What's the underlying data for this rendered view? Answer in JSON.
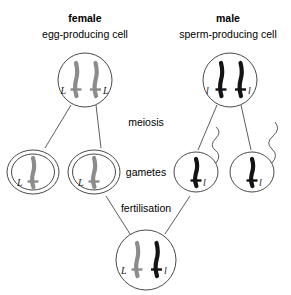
{
  "canvas": {
    "width": 291,
    "height": 295,
    "background": "#ffffff"
  },
  "colors": {
    "outline": "#4a4a4a",
    "text": "#1a1a1a",
    "chromosome_dominant": "#8c8c8c",
    "chromosome_recessive": "#141414"
  },
  "headers": {
    "female": {
      "title": "female",
      "subtitle": "egg-producing cell"
    },
    "male": {
      "title": "male",
      "subtitle": "sperm-producing cell"
    }
  },
  "stage_labels": {
    "meiosis": "meiosis",
    "gametes": "gametes",
    "fertilisation": "fertilisation"
  },
  "parent_cells": [
    {
      "name": "egg-producing-cell",
      "sex": "female",
      "cx": 85,
      "cy": 80,
      "r": 27,
      "chromosomes": [
        {
          "allele": "L",
          "color": "#8c8c8c",
          "label_side": "left",
          "x": 76
        },
        {
          "allele": "L",
          "color": "#8c8c8c",
          "label_side": "right",
          "x": 95
        }
      ]
    },
    {
      "name": "sperm-producing-cell",
      "sex": "male",
      "cx": 230,
      "cy": 80,
      "r": 27,
      "chromosomes": [
        {
          "allele": "l",
          "color": "#141414",
          "label_side": "left",
          "x": 221
        },
        {
          "allele": "l",
          "color": "#141414",
          "label_side": "right",
          "x": 240
        }
      ]
    }
  ],
  "gametes": [
    {
      "name": "egg-gamete-1",
      "type": "egg",
      "cx": 33,
      "cy": 172,
      "rx": 26,
      "ry": 22,
      "allele": "L",
      "color": "#8c8c8c",
      "double_membrane": true,
      "tail": false
    },
    {
      "name": "egg-gamete-2",
      "type": "egg",
      "cx": 94,
      "cy": 172,
      "rx": 26,
      "ry": 22,
      "allele": "L",
      "color": "#8c8c8c",
      "double_membrane": true,
      "tail": false
    },
    {
      "name": "sperm-gamete-1",
      "type": "sperm",
      "cx": 196,
      "cy": 172,
      "rx": 22,
      "ry": 20,
      "allele": "l",
      "color": "#141414",
      "double_membrane": false,
      "tail": true
    },
    {
      "name": "sperm-gamete-2",
      "type": "sperm",
      "cx": 252,
      "cy": 172,
      "rx": 22,
      "ry": 20,
      "allele": "l",
      "color": "#141414",
      "double_membrane": false,
      "tail": true
    }
  ],
  "zygote": {
    "name": "zygote-cell",
    "cx": 146,
    "cy": 260,
    "r": 30,
    "genotype": "Ll",
    "chromosomes": [
      {
        "allele": "L",
        "color": "#8c8c8c",
        "label_side": "left",
        "x": 137
      },
      {
        "allele": "l",
        "color": "#141414",
        "label_side": "right",
        "x": 156
      }
    ]
  },
  "connectors": {
    "meiosis_female": [
      {
        "from": [
          72,
          106
        ],
        "to": [
          44,
          148
        ]
      },
      {
        "from": [
          94,
          106
        ],
        "to": [
          100,
          148
        ]
      }
    ],
    "meiosis_male": [
      {
        "from": [
          218,
          106
        ],
        "to": [
          198,
          150
        ]
      },
      {
        "from": [
          240,
          106
        ],
        "to": [
          250,
          150
        ]
      }
    ],
    "fertilisation": [
      {
        "from": [
          106,
          197
        ],
        "to": [
          129,
          233
        ]
      },
      {
        "from": [
          192,
          197
        ],
        "to": [
          166,
          233
        ]
      }
    ]
  }
}
